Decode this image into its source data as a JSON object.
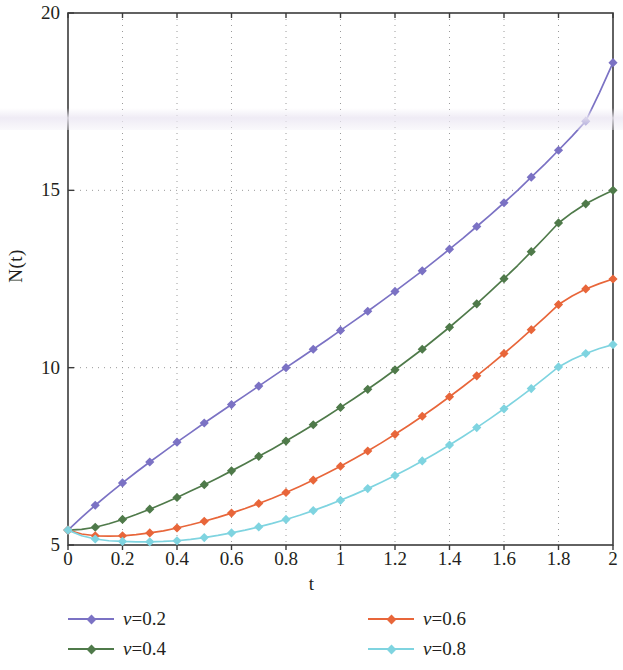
{
  "chart_data": {
    "type": "line",
    "title": "",
    "xlabel": "t",
    "ylabel": "N(t)",
    "xlim": [
      0,
      2
    ],
    "ylim": [
      5,
      20
    ],
    "xticks": [
      "0",
      "0.2",
      "0.4",
      "0.6",
      "0.8",
      "1",
      "1.2",
      "1.4",
      "1.6",
      "1.8",
      "2"
    ],
    "xtick_values": [
      0,
      0.2,
      0.4,
      0.6,
      0.8,
      1,
      1.2,
      1.4,
      1.6,
      1.8,
      2
    ],
    "yticks": [
      "5",
      "10",
      "15",
      "20"
    ],
    "ytick_values": [
      5,
      10,
      15,
      20
    ],
    "grid": true,
    "grid_style": "dotted",
    "legend_position": "below-plot",
    "marker": "diamond",
    "x": [
      0,
      0.05,
      0.1,
      0.15,
      0.2,
      0.25,
      0.3,
      0.35,
      0.4,
      0.45,
      0.5,
      0.55,
      0.6,
      0.65,
      0.7,
      0.75,
      0.8,
      0.85,
      0.9,
      0.95,
      1.0,
      1.05,
      1.1,
      1.15,
      1.2,
      1.25,
      1.3,
      1.35,
      1.4,
      1.45,
      1.5,
      1.55,
      1.6,
      1.65,
      1.7,
      1.75,
      1.8,
      1.85,
      1.9,
      1.95,
      2.0
    ],
    "series": [
      {
        "name": "v=0.2",
        "label": "ν=0.2",
        "color": "#7b72c4",
        "values": [
          5.42,
          5.78,
          6.12,
          6.44,
          6.75,
          7.05,
          7.34,
          7.62,
          7.9,
          8.17,
          8.44,
          8.7,
          8.96,
          9.22,
          9.48,
          9.74,
          10.0,
          10.26,
          10.52,
          10.78,
          11.05,
          11.32,
          11.59,
          11.87,
          12.15,
          12.44,
          12.73,
          13.03,
          13.34,
          13.65,
          13.98,
          14.31,
          14.65,
          15.0,
          15.37,
          15.74,
          16.13,
          16.53,
          16.95,
          17.75,
          18.6
        ]
      },
      {
        "name": "v=0.4",
        "label": "ν=0.4",
        "color": "#4f7a4a",
        "values": [
          5.42,
          5.44,
          5.5,
          5.6,
          5.72,
          5.86,
          6.01,
          6.17,
          6.34,
          6.52,
          6.7,
          6.89,
          7.09,
          7.29,
          7.5,
          7.71,
          7.93,
          8.16,
          8.39,
          8.63,
          8.88,
          9.13,
          9.39,
          9.66,
          9.94,
          10.23,
          10.52,
          10.83,
          11.14,
          11.47,
          11.8,
          12.15,
          12.51,
          12.88,
          13.27,
          13.67,
          14.08,
          14.37,
          14.62,
          14.82,
          15.0
        ]
      },
      {
        "name": "v=0.6",
        "label": "ν=0.6",
        "color": "#e8663a",
        "values": [
          5.42,
          5.31,
          5.26,
          5.25,
          5.26,
          5.29,
          5.34,
          5.4,
          5.48,
          5.57,
          5.67,
          5.78,
          5.9,
          6.03,
          6.17,
          6.32,
          6.48,
          6.65,
          6.83,
          7.02,
          7.22,
          7.43,
          7.65,
          7.88,
          8.12,
          8.37,
          8.63,
          8.9,
          9.18,
          9.47,
          9.77,
          10.08,
          10.4,
          10.73,
          11.07,
          11.42,
          11.78,
          12.02,
          12.22,
          12.37,
          12.5
        ]
      },
      {
        "name": "v=0.8",
        "label": "ν=0.8",
        "color": "#7fd4e0",
        "values": [
          5.42,
          5.26,
          5.17,
          5.12,
          5.1,
          5.09,
          5.09,
          5.1,
          5.12,
          5.16,
          5.21,
          5.27,
          5.34,
          5.42,
          5.51,
          5.61,
          5.72,
          5.84,
          5.97,
          6.11,
          6.26,
          6.42,
          6.59,
          6.77,
          6.96,
          7.16,
          7.37,
          7.59,
          7.82,
          8.06,
          8.31,
          8.57,
          8.84,
          9.12,
          9.41,
          9.71,
          10.02,
          10.23,
          10.4,
          10.54,
          10.65
        ]
      }
    ]
  },
  "legend": {
    "items": [
      {
        "label": "ν=0.2",
        "color": "#7b72c4"
      },
      {
        "label": "ν=0.4",
        "color": "#4f7a4a"
      },
      {
        "label": "ν=0.6",
        "color": "#e8663a"
      },
      {
        "label": "ν=0.8",
        "color": "#7fd4e0"
      }
    ]
  },
  "axes": {
    "x_title": "t",
    "y_title": "N(t)"
  }
}
